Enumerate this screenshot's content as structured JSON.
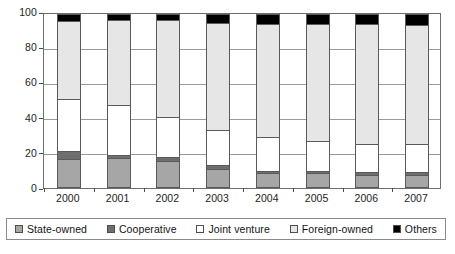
{
  "chart_data": {
    "type": "bar",
    "title": "",
    "subtitle": "",
    "xlabel": "",
    "ylabel": "",
    "stacked": true,
    "stack_total": 100,
    "grid": true,
    "legend_position": "bottom",
    "ylim": [
      0,
      100
    ],
    "yticks": [
      0,
      20,
      40,
      60,
      80,
      100
    ],
    "ytick_labels": [
      "0",
      "20",
      "40",
      "60",
      "80",
      "100"
    ],
    "categories": [
      "2000",
      "2001",
      "2002",
      "2003",
      "2004",
      "2005",
      "2006",
      "2007"
    ],
    "series": [
      {
        "name": "State-owned",
        "color": "#a6a6a6",
        "values": [
          16.5,
          17.0,
          15.5,
          11.0,
          8.5,
          8.5,
          7.5,
          7.5
        ]
      },
      {
        "name": "Cooperative",
        "color": "#6e6e6e",
        "values": [
          5.0,
          2.0,
          2.5,
          2.0,
          1.5,
          1.5,
          1.5,
          1.5
        ]
      },
      {
        "name": "Joint venture",
        "color": "#ffffff",
        "values": [
          29.5,
          28.5,
          23.0,
          20.5,
          19.5,
          17.0,
          16.5,
          16.5
        ]
      },
      {
        "name": "Foreign-owned",
        "color": "#e6e6e6",
        "values": [
          45.0,
          49.0,
          55.5,
          61.5,
          65.0,
          67.5,
          68.5,
          68.0
        ]
      },
      {
        "name": "Others",
        "color": "#000000",
        "values": [
          4.0,
          3.5,
          3.5,
          5.0,
          5.5,
          5.5,
          6.0,
          6.5
        ]
      }
    ]
  },
  "legend": {
    "items": [
      {
        "label": "State-owned",
        "color": "#a6a6a6"
      },
      {
        "label": "Cooperative",
        "color": "#6e6e6e"
      },
      {
        "label": "Joint venture",
        "color": "#ffffff"
      },
      {
        "label": "Foreign-owned",
        "color": "#e6e6e6"
      },
      {
        "label": "Others",
        "color": "#000000"
      }
    ]
  }
}
